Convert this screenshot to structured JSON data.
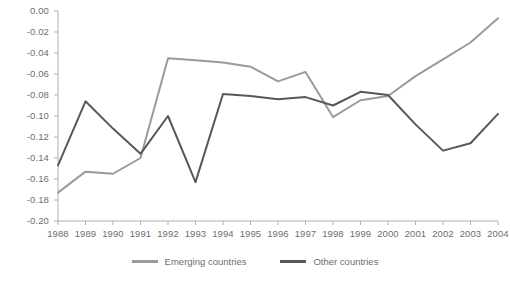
{
  "chart_data": {
    "type": "line",
    "title": "",
    "subtitle": "",
    "xlabel": "",
    "ylabel": "",
    "x": [
      1988,
      1989,
      1990,
      1991,
      1992,
      1993,
      1994,
      1995,
      1996,
      1997,
      1998,
      1999,
      2000,
      2001,
      2002,
      2003,
      2004
    ],
    "xtick_labels": [
      "1988",
      "1989",
      "1990",
      "1991",
      "1992",
      "1993",
      "1994",
      "1995",
      "1996",
      "1997",
      "1998",
      "1999",
      "2000",
      "2001",
      "2002",
      "2003",
      "2004"
    ],
    "ytick_labels": [
      "0.00",
      "-0.02",
      "-0.04",
      "-0.06",
      "-0.08",
      "-0.10",
      "-0.12",
      "-0.14",
      "-0.16",
      "-0.18",
      "-0.20"
    ],
    "ytick_values": [
      0.0,
      -0.02,
      -0.04,
      -0.06,
      -0.08,
      -0.1,
      -0.12,
      -0.14,
      -0.16,
      -0.18,
      -0.2
    ],
    "ylim": [
      -0.2,
      0.0
    ],
    "xlim": [
      1988,
      2004
    ],
    "grid": false,
    "legend_position": "bottom-center",
    "series": [
      {
        "name": "Emerging countries",
        "color": "#9a9a9a",
        "values": [
          -0.173,
          -0.153,
          -0.155,
          -0.14,
          -0.045,
          -0.047,
          -0.049,
          -0.053,
          -0.067,
          -0.058,
          -0.101,
          -0.085,
          -0.081,
          -0.062,
          -0.046,
          -0.03,
          -0.007
        ]
      },
      {
        "name": "Other countries",
        "color": "#585858",
        "values": [
          -0.147,
          -0.086,
          -0.112,
          -0.136,
          -0.1,
          -0.163,
          -0.079,
          -0.081,
          -0.084,
          -0.082,
          -0.09,
          -0.077,
          -0.08,
          -0.108,
          -0.133,
          -0.126,
          -0.098
        ]
      }
    ]
  },
  "legend": {
    "items": [
      {
        "label": "Emerging countries",
        "color": "#9a9a9a"
      },
      {
        "label": "Other countries",
        "color": "#585858"
      }
    ]
  },
  "axis": {
    "line_color": "#b0b0b0",
    "tick_color": "#b0b0b0"
  }
}
